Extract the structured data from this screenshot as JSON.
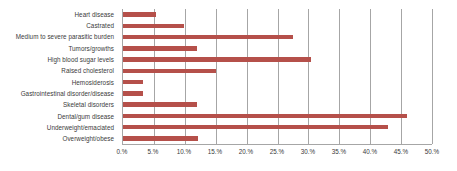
{
  "chart_data": {
    "type": "bar",
    "orientation": "horizontal",
    "title": "",
    "xlabel": "",
    "ylabel": "",
    "xlim": [
      0,
      50
    ],
    "xtick_labels": [
      "0.%",
      "5.%",
      "10.%",
      "15.%",
      "20.%",
      "25.%",
      "30.%",
      "35.%",
      "40.%",
      "45.%",
      "50.%"
    ],
    "xticks": [
      0,
      5,
      10,
      15,
      20,
      25,
      30,
      35,
      40,
      45,
      50
    ],
    "grid": true,
    "legend": "none",
    "bar_color": "#b5504a",
    "gridline_color": "#a6a6a6",
    "categories": [
      "Heart disease",
      "Castrated",
      "Medium to severe parasitic burden",
      "Tumors/growths",
      "High blood sugar levels",
      "Raised cholesterol",
      "Hemosiderosis",
      "Gastrointestinal disorder/disease",
      "Skeletal disorders",
      "Dental/gum disease",
      "Underweight/emaciated",
      "Overweight/obese"
    ],
    "values": [
      5.3,
      9.8,
      27.5,
      11.9,
      30.5,
      15.0,
      3.2,
      3.2,
      12.0,
      45.9,
      42.9,
      12.2
    ]
  }
}
